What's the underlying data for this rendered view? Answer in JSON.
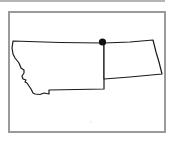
{
  "map": {
    "regions": [
      {
        "name": "Montana",
        "outline_color": "#1a1a1a",
        "fill": "#ffffff"
      },
      {
        "name": "North Dakota",
        "outline_color": "#1a1a1a",
        "fill": "#ffffff"
      }
    ],
    "marker": {
      "label": "Border point",
      "color": "#111111"
    },
    "frame_color": "#9a9a9a",
    "top_bar_color": "#b5b5b5"
  }
}
